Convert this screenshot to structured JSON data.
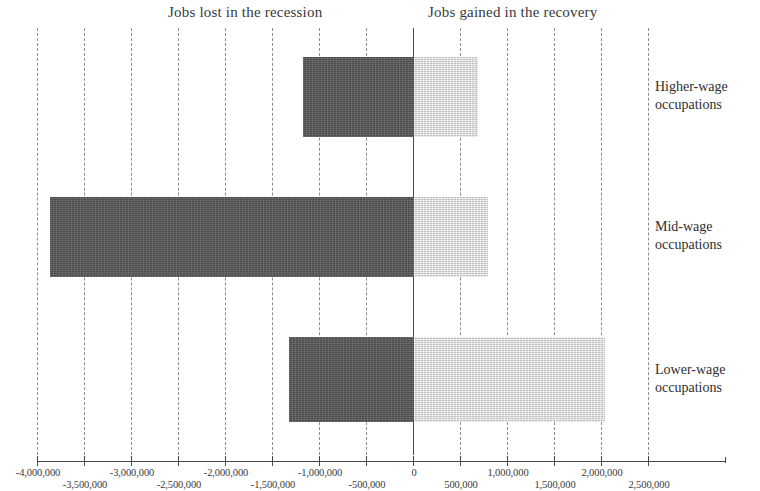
{
  "headings": {
    "left": "Jobs lost in the recession",
    "right": "Jobs gained in the recovery"
  },
  "categories": [
    {
      "line1": "Higher-wage",
      "line2": "occupations"
    },
    {
      "line1": "Mid-wage",
      "line2": "occupations"
    },
    {
      "line1": "Lower-wage",
      "line2": "occupations"
    }
  ],
  "axis": {
    "ticks": [
      {
        "value": -4000000,
        "label": "-4,000,000",
        "row": "top"
      },
      {
        "value": -3500000,
        "label": "-3,500,000",
        "row": "bottom"
      },
      {
        "value": -3000000,
        "label": "-3,000,000",
        "row": "top"
      },
      {
        "value": -2500000,
        "label": "-2,500,000",
        "row": "bottom"
      },
      {
        "value": -2000000,
        "label": "-2,000,000",
        "row": "top"
      },
      {
        "value": -1500000,
        "label": "-1,500,000",
        "row": "bottom"
      },
      {
        "value": -1000000,
        "label": "-1,000,000",
        "row": "top"
      },
      {
        "value": -500000,
        "label": "-500,000",
        "row": "bottom"
      },
      {
        "value": 0,
        "label": "0",
        "row": "top"
      },
      {
        "value": 500000,
        "label": "500,000",
        "row": "bottom"
      },
      {
        "value": 1000000,
        "label": "1,000,000",
        "row": "top"
      },
      {
        "value": 1500000,
        "label": "1,500,000",
        "row": "bottom"
      },
      {
        "value": 2000000,
        "label": "2,000,000",
        "row": "top"
      },
      {
        "value": 2500000,
        "label": "2,500,000",
        "row": "bottom"
      }
    ]
  },
  "colors": {
    "loss_bar": "#565658",
    "gain_bar": "#d8d8d8",
    "axis": "#46454a",
    "gridline": "#8e8d90",
    "text": "#2f2e30"
  },
  "chart_data": {
    "type": "bar",
    "title": "",
    "subtitle": "",
    "orientation": "horizontal",
    "xlabel": "",
    "ylabel": "",
    "xlim": [
      -4000000,
      2500000
    ],
    "xticks": [
      -4000000,
      -3500000,
      -3000000,
      -2500000,
      -2000000,
      -1500000,
      -1000000,
      -500000,
      0,
      500000,
      1000000,
      1500000,
      2000000,
      2500000
    ],
    "grid": true,
    "grid_style": "dashed vertical",
    "legend": "none",
    "annotations": [
      "Jobs lost in the recession",
      "Jobs gained in the recovery"
    ],
    "categories": [
      "Higher-wage occupations",
      "Mid-wage occupations",
      "Lower-wage occupations"
    ],
    "series": [
      {
        "name": "Jobs lost in the recession",
        "values": [
          -1180000,
          -3870000,
          -1330000
        ]
      },
      {
        "name": "Jobs gained in the recovery",
        "values": [
          680000,
          790000,
          2030000
        ]
      }
    ]
  },
  "geometry": {
    "zero_px": 414,
    "px_per_million": 94,
    "axis_left_px": 38,
    "axis_right_px": 725,
    "rows": [
      {
        "top": 29,
        "height": 80
      },
      {
        "top": 169,
        "height": 80
      },
      {
        "top": 309,
        "height": 85
      }
    ]
  }
}
